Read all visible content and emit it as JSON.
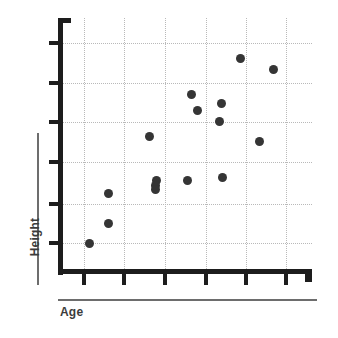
{
  "chart_data": {
    "type": "scatter",
    "title": "",
    "xlabel": "Age",
    "ylabel": "Height",
    "grid": true,
    "legend": null,
    "xlim": [
      0,
      7
    ],
    "ylim": [
      0,
      7
    ],
    "xtick_labels": [
      "",
      "",
      "",
      "",
      "",
      ""
    ],
    "ytick_labels": [
      "",
      "",
      "",
      "",
      "",
      ""
    ],
    "point_color": "#353535",
    "grid_color": "#b9b9b9",
    "axis_color": "#1d1d1d",
    "label_color": "#3c3c3c",
    "background": "#ffffff",
    "n_points": 16,
    "points": [
      {
        "x": 0.77,
        "y": 0.75
      },
      {
        "x": 1.25,
        "y": 2.0
      },
      {
        "x": 1.25,
        "y": 1.25
      },
      {
        "x": 2.27,
        "y": 3.28
      },
      {
        "x": 2.45,
        "y": 2.15
      },
      {
        "x": 2.43,
        "y": 2.05
      },
      {
        "x": 2.42,
        "y": 1.87
      },
      {
        "x": 3.23,
        "y": 1.85
      },
      {
        "x": 3.33,
        "y": 4.5
      },
      {
        "x": 3.48,
        "y": 4.1
      },
      {
        "x": 4.08,
        "y": 4.33
      },
      {
        "x": 4.03,
        "y": 3.78
      },
      {
        "x": 4.1,
        "y": 1.98
      },
      {
        "x": 5.01,
        "y": 3.15
      },
      {
        "x": 4.55,
        "y": 5.42
      },
      {
        "x": 5.38,
        "y": 5.12
      }
    ],
    "points_px": [
      {
        "cx": 31,
        "cy": 225
      },
      {
        "cx": 50,
        "cy": 175
      },
      {
        "cx": 50,
        "cy": 205
      },
      {
        "cx": 91,
        "cy": 118
      },
      {
        "cx": 98,
        "cy": 162
      },
      {
        "cx": 97,
        "cy": 167
      },
      {
        "cx": 97,
        "cy": 171
      },
      {
        "cx": 129,
        "cy": 162
      },
      {
        "cx": 133,
        "cy": 76
      },
      {
        "cx": 139,
        "cy": 92
      },
      {
        "cx": 163,
        "cy": 85
      },
      {
        "cx": 161,
        "cy": 103
      },
      {
        "cx": 164,
        "cy": 159
      },
      {
        "cx": 201,
        "cy": 123
      },
      {
        "cx": 182,
        "cy": 40
      },
      {
        "cx": 215,
        "cy": 51
      }
    ],
    "gridlines_x_px": [
      26,
      66,
      107,
      148,
      188,
      228
    ],
    "gridlines_y_px": [
      25,
      65,
      104,
      144,
      186,
      225
    ],
    "y_ticks_px": [
      41,
      81,
      120,
      160,
      202,
      241
    ],
    "x_ticks_px": [
      82,
      122,
      163,
      204,
      244,
      284
    ]
  },
  "axis_titles": {
    "x": "Age",
    "y": "Height"
  }
}
